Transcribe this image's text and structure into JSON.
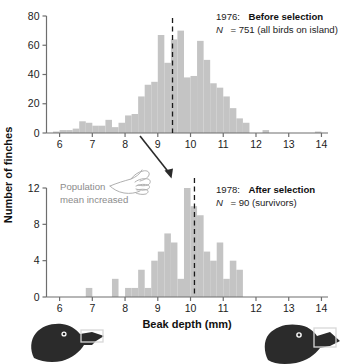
{
  "figure": {
    "y_axis_label": "Number of finches",
    "x_axis_label": "Beak depth (mm)",
    "bar_color": "#c4c4c4",
    "axis_color": "#6e6e6e",
    "mean_line_color": "#1a1a1a",
    "annotation_color": "#8c8c8c",
    "bird_color": "#2b2b2b"
  },
  "panel_top": {
    "year": "1976:",
    "title": "Before selection",
    "n_prefix": "N",
    "n_eq": "= 751 (all birds on island)",
    "mean_value": 9.45
  },
  "panel_bottom": {
    "year": "1978:",
    "title": "After selection",
    "n_prefix": "N",
    "n_eq": "= 90 (survivors)",
    "mean_value": 10.12,
    "callout_line1": "Population",
    "callout_line2": "mean increased"
  },
  "chart_data": [
    {
      "type": "bar",
      "id": "1976-before-selection",
      "title": "1976: Before selection",
      "subtitle": "N = 751 (all birds on island)",
      "xlabel": "Beak depth (mm)",
      "ylabel": "Number of finches",
      "xlim": [
        5.6,
        14.2
      ],
      "ylim": [
        0,
        80
      ],
      "xticks": [
        6,
        7,
        8,
        9,
        10,
        11,
        12,
        13,
        14
      ],
      "yticks": [
        0,
        20,
        40,
        60,
        80
      ],
      "grid": false,
      "bin_width": 0.2,
      "annotations": [
        {
          "type": "vline",
          "x": 9.45,
          "style": "dashed",
          "label": "population mean"
        }
      ],
      "x": [
        5.9,
        6.1,
        6.3,
        6.5,
        6.7,
        6.9,
        7.1,
        7.3,
        7.5,
        7.7,
        7.9,
        8.1,
        8.3,
        8.5,
        8.7,
        8.9,
        9.1,
        9.3,
        9.5,
        9.7,
        9.9,
        10.1,
        10.3,
        10.5,
        10.7,
        10.9,
        11.1,
        11.3,
        11.5,
        11.7,
        12.3,
        13.9
      ],
      "values": [
        1,
        2,
        2,
        3,
        8,
        7,
        5,
        5,
        9,
        4,
        7,
        12,
        13,
        25,
        33,
        35,
        67,
        48,
        64,
        70,
        38,
        39,
        63,
        50,
        34,
        31,
        25,
        17,
        10,
        7,
        2,
        1
      ]
    },
    {
      "type": "bar",
      "id": "1978-after-selection",
      "title": "1978: After selection",
      "subtitle": "N = 90 (survivors)",
      "xlabel": "Beak depth (mm)",
      "ylabel": "Number of finches",
      "xlim": [
        5.6,
        14.2
      ],
      "ylim": [
        0,
        12
      ],
      "xticks": [
        6,
        7,
        8,
        9,
        10,
        11,
        12,
        13,
        14
      ],
      "yticks": [
        0,
        4,
        8,
        12
      ],
      "grid": false,
      "bin_width": 0.2,
      "annotations": [
        {
          "type": "vline",
          "x": 10.12,
          "style": "dashed",
          "label": "population mean increased"
        }
      ],
      "x": [
        6.9,
        7.7,
        8.1,
        8.3,
        8.5,
        8.7,
        8.9,
        9.1,
        9.3,
        9.5,
        9.7,
        9.9,
        10.1,
        10.3,
        10.5,
        10.7,
        10.9,
        11.1,
        11.3,
        11.5
      ],
      "values": [
        1,
        2,
        1,
        1,
        3,
        1,
        4,
        5,
        7,
        6,
        2,
        12,
        10,
        9,
        5,
        4,
        6,
        2,
        4,
        3
      ]
    }
  ],
  "birds": {
    "left_label": "small-beak-finch",
    "right_label": "large-beak-finch"
  }
}
